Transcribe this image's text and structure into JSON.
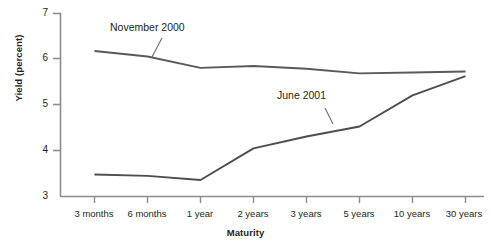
{
  "chart_data": {
    "type": "line",
    "title": "",
    "xlabel": "Maturity",
    "ylabel": "Yield (percent)",
    "categories": [
      "3 months",
      "6 months",
      "1 year",
      "2 years",
      "3 years",
      "5 years",
      "10 years",
      "30 years"
    ],
    "ylim": [
      3,
      7
    ],
    "yticks": [
      3,
      4,
      5,
      6,
      7
    ],
    "ytick_labels": [
      "3",
      "4",
      "5",
      "6",
      "7"
    ],
    "grid": false,
    "legend_position": "inline-annotation",
    "series": [
      {
        "name": "November 2000",
        "color": "#595959",
        "values": [
          6.17,
          6.05,
          5.8,
          5.84,
          5.78,
          5.68,
          5.7,
          5.72
        ],
        "annotation": {
          "text": "November 2000",
          "x_px": 110,
          "y_px": 27
        }
      },
      {
        "name": "June 2001",
        "color": "#4d4d4d",
        "values": [
          3.47,
          3.44,
          3.35,
          4.04,
          4.3,
          4.52,
          5.2,
          5.62
        ],
        "annotation": {
          "text": "June 2001",
          "x_px": 277,
          "y_px": 95
        }
      }
    ],
    "axis_color": "#8c8c8c",
    "background": "#ffffff"
  }
}
